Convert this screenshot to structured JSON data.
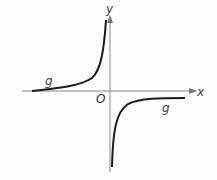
{
  "diagram": {
    "type": "function-graph",
    "function_name": "g",
    "axes": {
      "x_label": "x",
      "y_label": "y",
      "origin_label": "O"
    },
    "curve_labels": [
      "g",
      "g"
    ],
    "colors": {
      "curve": "#1a1a1a",
      "axes": "#777777",
      "labels": "#444444"
    }
  }
}
